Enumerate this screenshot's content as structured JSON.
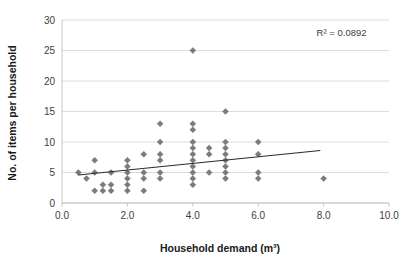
{
  "chart_data": {
    "type": "scatter",
    "title": "",
    "xlabel": "Household demand (m³)",
    "ylabel": "No. of items per household",
    "xlim": [
      0.0,
      10.0
    ],
    "ylim": [
      0,
      30
    ],
    "xticks": [
      "0.0",
      "2.0",
      "4.0",
      "6.0",
      "8.0",
      "10.0"
    ],
    "xtick_values": [
      0,
      2,
      4,
      6,
      8,
      10
    ],
    "yticks": [
      "0",
      "5",
      "10",
      "15",
      "20",
      "25",
      "30"
    ],
    "ytick_values": [
      0,
      5,
      10,
      15,
      20,
      25,
      30
    ],
    "grid": "horizontal",
    "legend": "none",
    "marker_shape": "diamond",
    "marker_color": "#7b7b7b",
    "trendline_color": "#2b2b2b",
    "annotations": [
      {
        "text": "R² = 0.0892",
        "x": 8.55,
        "y": 27.3
      }
    ],
    "series": [
      {
        "name": "Households",
        "points": [
          [
            0.5,
            5
          ],
          [
            0.75,
            4
          ],
          [
            1.0,
            7
          ],
          [
            1.0,
            5
          ],
          [
            1.0,
            2
          ],
          [
            1.25,
            3
          ],
          [
            1.25,
            2
          ],
          [
            1.5,
            5
          ],
          [
            1.5,
            3
          ],
          [
            1.5,
            2
          ],
          [
            2.0,
            7
          ],
          [
            2.0,
            6
          ],
          [
            2.0,
            5
          ],
          [
            2.0,
            4
          ],
          [
            2.0,
            3
          ],
          [
            2.0,
            2
          ],
          [
            2.5,
            8
          ],
          [
            2.5,
            5
          ],
          [
            2.5,
            4
          ],
          [
            2.5,
            2
          ],
          [
            3.0,
            13
          ],
          [
            3.0,
            10
          ],
          [
            3.0,
            8
          ],
          [
            3.0,
            7
          ],
          [
            3.0,
            5
          ],
          [
            3.0,
            4
          ],
          [
            4.0,
            25
          ],
          [
            4.0,
            13
          ],
          [
            4.0,
            12
          ],
          [
            4.0,
            10
          ],
          [
            4.0,
            9
          ],
          [
            4.0,
            8
          ],
          [
            4.0,
            7
          ],
          [
            4.0,
            6
          ],
          [
            4.0,
            5
          ],
          [
            4.0,
            4
          ],
          [
            4.0,
            3
          ],
          [
            4.5,
            9
          ],
          [
            4.5,
            8
          ],
          [
            4.5,
            5
          ],
          [
            5.0,
            15
          ],
          [
            5.0,
            10
          ],
          [
            5.0,
            9
          ],
          [
            5.0,
            8
          ],
          [
            5.0,
            7
          ],
          [
            5.0,
            6
          ],
          [
            5.0,
            5
          ],
          [
            5.0,
            4
          ],
          [
            6.0,
            10
          ],
          [
            6.0,
            8
          ],
          [
            6.0,
            5
          ],
          [
            6.0,
            4
          ],
          [
            8.0,
            4
          ]
        ]
      }
    ],
    "trendline": {
      "x0": 0.5,
      "y0": 4.6,
      "x1": 7.9,
      "y1": 8.6
    }
  }
}
